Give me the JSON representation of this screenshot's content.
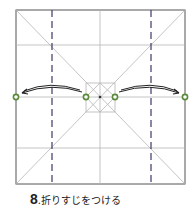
{
  "step": {
    "number": "8",
    "separator": ".",
    "instruction": "折りすじをつける"
  },
  "colors": {
    "outline": "#555555",
    "crease": "#b0b0b0",
    "valley_fold": "#3a3a6a",
    "marker": "#5a8a3a",
    "arrow": "#222222"
  },
  "markers": [
    {
      "id": "left-edge",
      "x": 16,
      "y": 97
    },
    {
      "id": "center-left",
      "x": 86,
      "y": 97
    },
    {
      "id": "center-right",
      "x": 115,
      "y": 97
    },
    {
      "id": "right-edge",
      "x": 185,
      "y": 97
    }
  ]
}
